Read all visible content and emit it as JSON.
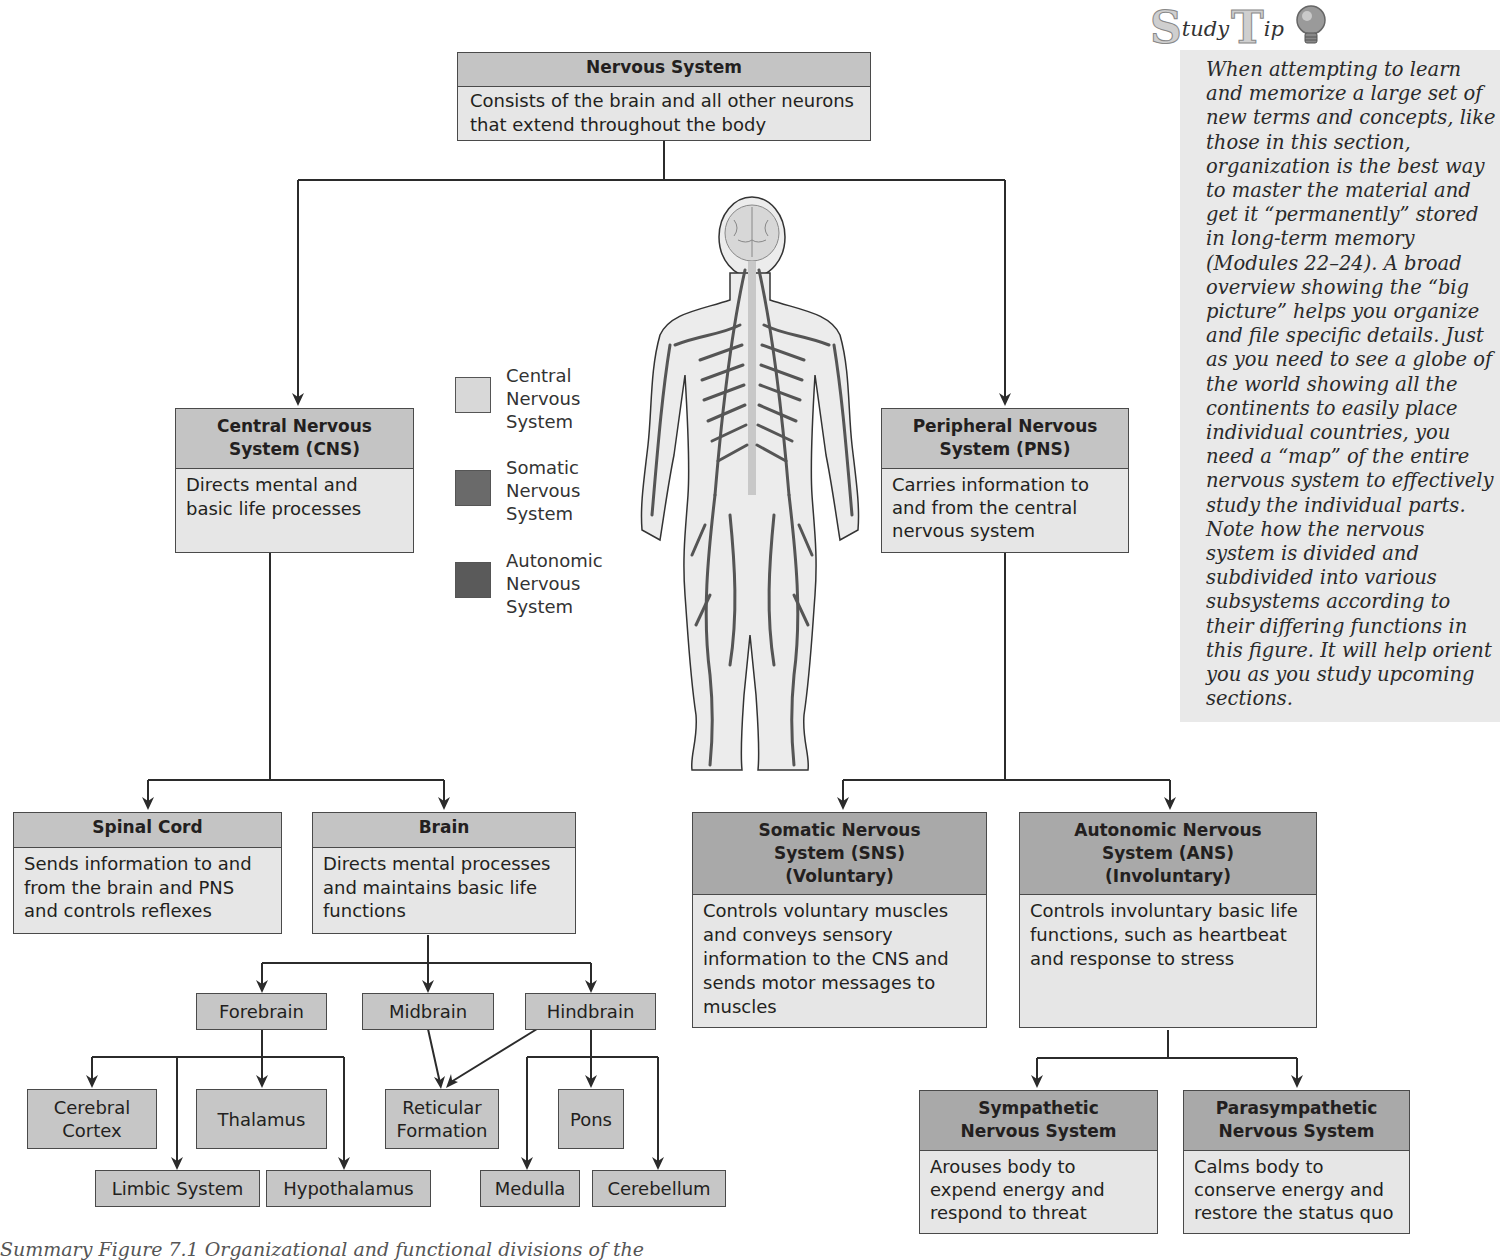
{
  "diagram": {
    "root": {
      "title": "Nervous System",
      "description": "Consists of the brain and all other neurons that extend throughout the body"
    },
    "cns": {
      "title": "Central Nervous System (CNS)",
      "description": "Directs mental and basic life processes"
    },
    "pns": {
      "title": "Peripheral Nervous System (PNS)",
      "description": "Carries information to and from the central nervous system"
    },
    "spinal_cord": {
      "title": "Spinal Cord",
      "description": "Sends information to and from the brain and PNS and controls reflexes"
    },
    "brain": {
      "title": "Brain",
      "description": "Directs mental processes and maintains basic life functions"
    },
    "sns": {
      "title": "Somatic Nervous System (SNS) (Voluntary)",
      "description": "Controls voluntary muscles and conveys sensory information to the CNS and sends motor messages to muscles"
    },
    "ans": {
      "title": "Autonomic Nervous System (ANS) (Involuntary)",
      "description": "Controls involuntary basic life functions, such as heartbeat and response to stress"
    },
    "sympathetic": {
      "title": "Sympathetic Nervous System",
      "description": "Arouses body to expend energy and respond to threat"
    },
    "parasympathetic": {
      "title": "Parasympathetic Nervous System",
      "description": "Calms body to conserve energy and restore the status quo"
    },
    "brain_parts": {
      "forebrain": "Forebrain",
      "midbrain": "Midbrain",
      "hindbrain": "Hindbrain",
      "cerebral_cortex": "Cerebral Cortex",
      "thalamus": "Thalamus",
      "limbic_system": "Limbic System",
      "hypothalamus": "Hypothalamus",
      "reticular_formation": "Reticular Formation",
      "pons": "Pons",
      "medulla": "Medulla",
      "cerebellum": "Cerebellum"
    }
  },
  "legend": {
    "items": [
      {
        "label": "Central\nNervous\nSystem",
        "color": "#d8d8d8"
      },
      {
        "label": "Somatic\nNervous\nSystem",
        "color": "#6a6a6a"
      },
      {
        "label": "Autonomic\nNervous\nSystem",
        "color": "#5a5a5a"
      }
    ]
  },
  "study_tip": {
    "title_big_s": "S",
    "title_tudy": "tudy",
    "title_big_t": "T",
    "title_ip": "ip",
    "icon": "lightbulb-icon",
    "text": "When attempting to learn and memorize a large set of new terms and concepts, like those in this section, organization is the best way to master the material and get it “permanently” stored in long-term memory (Modules 22–24). A broad overview showing the “big picture” helps you organize and file specific details. Just as you need to see a globe of the world showing all the continents to easily place individual countries, you need a “map” of the entire nervous system to effectively study the individual parts. Note how the nervous system is divided and subdivided into various subsystems according to their differing functions in this figure. It will help orient you as you study upcoming sections."
  },
  "caption": {
    "text": "Summary Figure 7.1  Organizational and functional divisions of the"
  },
  "colors": {
    "header_gray": "#c4c4c4",
    "header_dark": "#a9a9a9",
    "body_light": "#e6e6e6",
    "line": "#2b2b2b"
  }
}
